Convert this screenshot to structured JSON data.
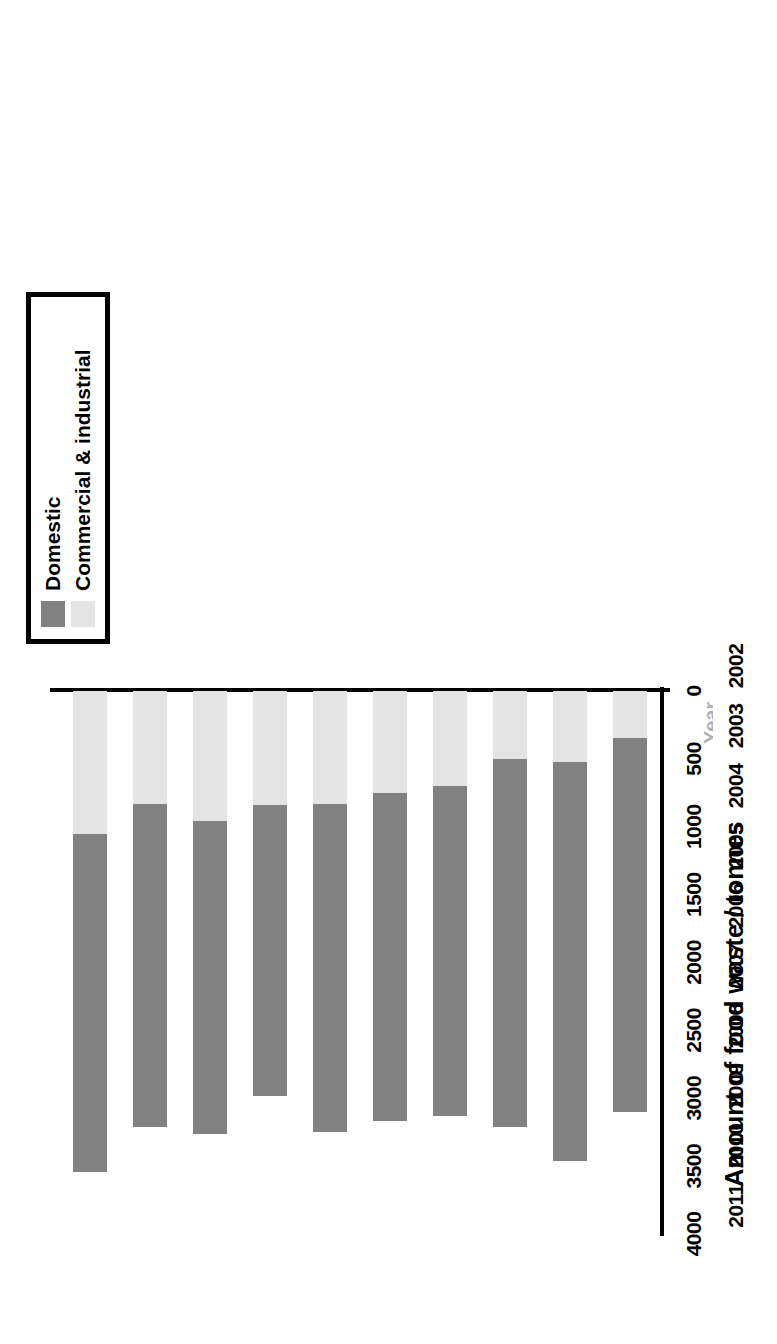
{
  "chart_data": {
    "type": "bar",
    "subtype": "stacked-horizontal-rotated",
    "title": "",
    "xlabel": "Year",
    "ylabel": "Amount of food waste / tonnes",
    "categories": [
      "2002",
      "2003",
      "2004",
      "2005",
      "2006",
      "2007",
      "2008",
      "2009",
      "2010",
      "2011"
    ],
    "ylim": [
      0,
      4000
    ],
    "yticks": [
      0,
      500,
      1000,
      1500,
      2000,
      2500,
      3000,
      3500,
      4000
    ],
    "grid": false,
    "legend_position": "top-left",
    "series": [
      {
        "name": "Domestic",
        "color": "#818181",
        "values": [
          2750,
          2940,
          2710,
          2430,
          2420,
          2420,
          2140,
          2300,
          2380,
          2490
        ]
      },
      {
        "name": "Commercial & industrial",
        "color": "#e4e4e4",
        "values": [
          350,
          520,
          500,
          700,
          750,
          830,
          840,
          960,
          830,
          1050
        ]
      }
    ],
    "totals": [
      3100,
      3460,
      3210,
      3130,
      3170,
      3250,
      2980,
      3260,
      3210,
      3540
    ]
  },
  "legend": {
    "items": [
      {
        "label": "Domestic",
        "color": "#818181"
      },
      {
        "label": "Commercial & industrial",
        "color": "#e4e4e4"
      }
    ]
  },
  "axis": {
    "y_title": "Amount of food waste / tonnes",
    "x_title": "Year",
    "tick_labels": [
      "0",
      "500",
      "1000",
      "1500",
      "2000",
      "2500",
      "3000",
      "3500",
      "4000"
    ],
    "year_labels": [
      "2002",
      "2003",
      "2004",
      "2005",
      "2006",
      "2007",
      "2008",
      "2009",
      "2010",
      "2011"
    ]
  }
}
